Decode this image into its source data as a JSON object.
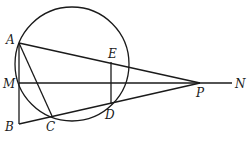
{
  "diagram": {
    "type": "geometry",
    "circle": {
      "cx": 72,
      "cy": 64,
      "r": 57
    },
    "points": {
      "A": {
        "x": 19,
        "y": 43,
        "label": "A",
        "lx": 6,
        "ly": 44
      },
      "M": {
        "x": 19,
        "y": 83,
        "label": "M",
        "lx": 3,
        "ly": 88
      },
      "B": {
        "x": 19,
        "y": 124,
        "label": "B",
        "lx": 5,
        "ly": 131
      },
      "C": {
        "x": 52,
        "y": 116,
        "label": "C",
        "lx": 46,
        "ly": 131
      },
      "D": {
        "x": 111,
        "y": 104,
        "label": "D",
        "lx": 105,
        "ly": 119
      },
      "E": {
        "x": 111,
        "y": 62,
        "label": "E",
        "lx": 108,
        "ly": 58
      },
      "P": {
        "x": 200,
        "y": 83,
        "label": "P",
        "lx": 196,
        "ly": 97
      },
      "N": {
        "x": 232,
        "y": 83,
        "label": "N",
        "lx": 235,
        "ly": 88
      }
    },
    "segments": [
      [
        "A",
        "B"
      ],
      [
        "A",
        "C"
      ],
      [
        "A",
        "P"
      ],
      [
        "B",
        "P"
      ],
      [
        "M",
        "N"
      ],
      [
        "E",
        "D"
      ]
    ]
  }
}
